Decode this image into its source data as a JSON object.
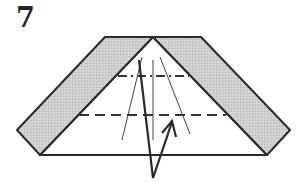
{
  "diagram": {
    "step_number": "7",
    "colors": {
      "outline": "#2a2a2a",
      "shaded_paper": "#c8c8c8",
      "paper": "#ffffff",
      "crease": "#555555"
    },
    "elements": {
      "left_flap": "shaded strip folded down on left",
      "right_flap": "shaded strip folded down on right",
      "mountain_fold_line": "dash-dot line upper",
      "valley_fold_line": "dashed line lower",
      "arrow": "fold-up arrow"
    }
  }
}
